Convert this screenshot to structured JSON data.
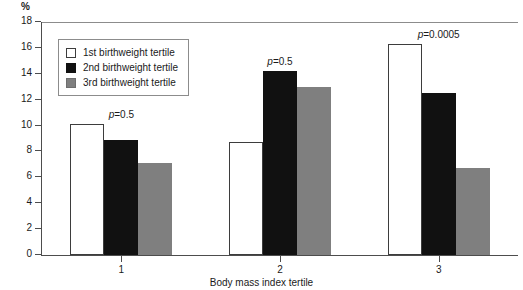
{
  "chart_data": {
    "type": "bar",
    "title": "",
    "xlabel": "Body mass index tertile",
    "ylabel": "%",
    "categories": [
      "1",
      "2",
      "3"
    ],
    "series": [
      {
        "name": "1st birthweight tertile",
        "color": "#ffffff",
        "values": [
          10.1,
          8.7,
          16.3
        ]
      },
      {
        "name": "2nd birthweight tertile",
        "color": "#111111",
        "values": [
          8.9,
          14.2,
          12.5
        ]
      },
      {
        "name": "3rd birthweight tertile",
        "color": "#7f7f7f",
        "values": [
          7.1,
          13.0,
          6.7
        ]
      }
    ],
    "ylim": [
      0,
      18
    ],
    "yticks": [
      0,
      2,
      4,
      6,
      8,
      10,
      12,
      14,
      16,
      18
    ],
    "ytick_labels": [
      "0",
      "2",
      "4",
      "6",
      "8",
      "10",
      "12",
      "14",
      "16",
      "18"
    ],
    "grid": false,
    "legend_position": "upper-left",
    "annotations": [
      {
        "text": "p=0.5",
        "group": "1"
      },
      {
        "text": "p=0.5",
        "group": "2"
      },
      {
        "text": "p=0.0005",
        "group": "3"
      }
    ]
  },
  "axis": {
    "unit_label": "%",
    "x_title": "Body mass index tertile"
  },
  "legend": {
    "entries": [
      {
        "label": "1st birthweight tertile"
      },
      {
        "label": "2nd birthweight tertile"
      },
      {
        "label": "3rd birthweight tertile"
      }
    ]
  }
}
